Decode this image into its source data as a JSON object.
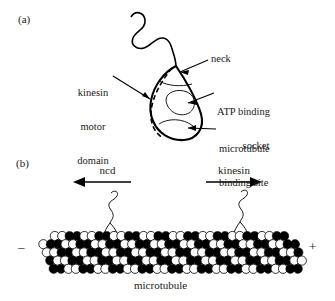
{
  "figure": {
    "panels": [
      {
        "tag": "(a)",
        "name": "kinesin-molecule-schematic"
      },
      {
        "tag": "(b)",
        "name": "microtubule-motors-schematic"
      }
    ]
  },
  "panel_a": {
    "tag": "(a)",
    "labels": {
      "kinesin_motor_domain": "kinesin\nmotor\ndomain",
      "kinesin_motor_domain_lines": [
        "kinesin",
        "motor",
        "domain"
      ],
      "neck": "neck",
      "atp_binding_socket": "ATP binding\nsocket",
      "atp_binding_socket_lines": [
        "ATP binding",
        "socket"
      ],
      "microtubule_binding_site": "microtubule\nbinding site",
      "microtubule_binding_site_lines": [
        "microtubule",
        "binding site"
      ]
    }
  },
  "panel_b": {
    "tag": "(b)",
    "motors": [
      {
        "label": "ncd",
        "direction": "left"
      },
      {
        "label": "kinesin",
        "direction": "right"
      }
    ],
    "ncd_label": "ncd",
    "kinesin_label": "kinesin",
    "minus_end": "–",
    "plus_end": "+",
    "caption": "microtubule"
  },
  "colors": {
    "ink": "#000000",
    "background": "#ffffff",
    "subunit_dark": "#000000",
    "subunit_light": "#ffffff"
  }
}
